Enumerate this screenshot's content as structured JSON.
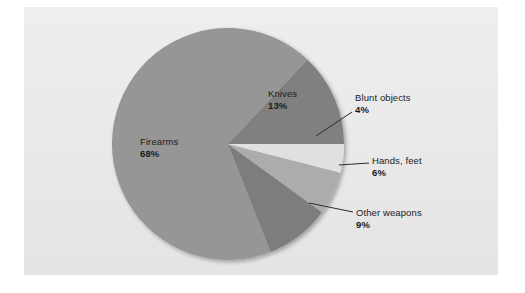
{
  "figure": {
    "background_color": "#ffffff",
    "panel_color": "#eaeaea",
    "panel_border_color": "#d8d8d8"
  },
  "chart_data": {
    "type": "pie",
    "title": "",
    "subtitle": "",
    "xlabel": "",
    "ylabel": "",
    "grid": false,
    "legend_position": "none",
    "label_format": "name + percent",
    "start_angle_deg": 0,
    "direction": "counterclockwise",
    "center": {
      "x": 228,
      "y": 144
    },
    "radius": 116,
    "categories": [
      "Firearms",
      "Knives",
      "Blunt objects",
      "Hands, feet",
      "Other weapons"
    ],
    "values": [
      68,
      13,
      4,
      6,
      9
    ],
    "units": "percent",
    "slices": [
      {
        "name": "Firearms",
        "value": 68,
        "percent_label": "68%",
        "color": "#969696",
        "label_placement": "inside",
        "leader_line": false
      },
      {
        "name": "Knives",
        "value": 13,
        "percent_label": "13%",
        "color": "#808080",
        "label_placement": "inside",
        "leader_line": false
      },
      {
        "name": "Blunt objects",
        "value": 4,
        "percent_label": "4%",
        "color": "#e0e0e0",
        "label_placement": "outside",
        "leader_line": true
      },
      {
        "name": "Hands, feet",
        "value": 6,
        "percent_label": "6%",
        "color": "#acacac",
        "label_placement": "outside",
        "leader_line": true
      },
      {
        "name": "Other weapons",
        "value": 9,
        "percent_label": "9%",
        "color": "#7d7d7d",
        "label_placement": "outside",
        "leader_line": true
      }
    ]
  }
}
